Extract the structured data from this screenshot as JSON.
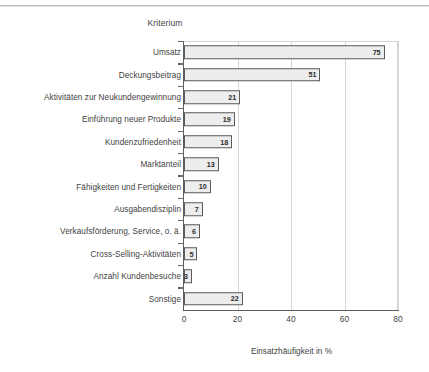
{
  "chart_data": {
    "type": "bar",
    "orientation": "horizontal",
    "title": "Kriterium",
    "xlabel": "Einsatzhäufigkeit in %",
    "ylabel": "",
    "xlim": [
      0,
      80
    ],
    "xticks": [
      0,
      20,
      40,
      60,
      80
    ],
    "grid": true,
    "legend": false,
    "categories": [
      "Umsatz",
      "Deckungsbeitrag",
      "Aktivitäten zur Neukundengewinnung",
      "Einführung neuer Produkte",
      "Kundenzufriedenheit",
      "Marktanteil",
      "Fähigkeiten und Fertigkeiten",
      "Ausgabendisziplin",
      "Verkaufsförderung, Service, o. ä.",
      "Cross-Selling-Aktivitäten",
      "Anzahl Kundenbesuche",
      "Sonstige"
    ],
    "values": [
      75,
      51,
      21,
      19,
      18,
      13,
      10,
      7,
      6,
      5,
      3,
      22
    ],
    "bar_fill": "#ededed",
    "bar_border": "#5b5b5b",
    "axis_color": "#5d5d5d",
    "grid_color": "#d6d6d6",
    "text_color": "#3f3f3f"
  }
}
